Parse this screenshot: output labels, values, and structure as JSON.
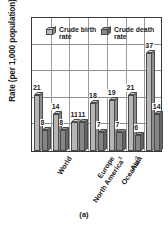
{
  "chart_data": {
    "type": "bar",
    "title": "",
    "xlabel": "",
    "ylabel": "Rate (per 1,000 population)",
    "ylim": [
      0,
      50
    ],
    "yticks": [
      0,
      10,
      20,
      30,
      40,
      50
    ],
    "grid": true,
    "legend_position": "top-inside",
    "categories": [
      "World",
      "North America",
      "Europe",
      "Oceania",
      "Asia",
      "Latin America and the Caribbean",
      "Africa"
    ],
    "category_marks": [
      "",
      "1",
      "",
      "2",
      "",
      "",
      ""
    ],
    "series": [
      {
        "name": "Crude birth rate",
        "values": [
          21,
          14,
          11,
          18,
          19,
          21,
          37
        ]
      },
      {
        "name": "Crude death rate",
        "values": [
          8,
          8,
          11,
          7,
          7,
          6,
          14
        ]
      }
    ]
  },
  "caption": "(a)"
}
